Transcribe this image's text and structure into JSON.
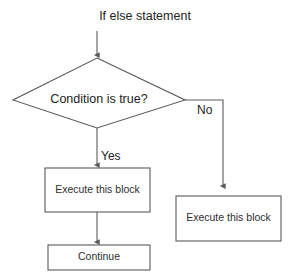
{
  "diagram": {
    "title": "If else statement",
    "type": "flowchart",
    "background_color": "#ffffff",
    "stroke_color": "#5a5a5a",
    "text_color": "#242424",
    "nodes": {
      "decision": {
        "label": "Condition is true?",
        "shape": "diamond"
      },
      "execute_true": {
        "label": "Execute this block",
        "shape": "rectangle"
      },
      "execute_false": {
        "label": "Execute this block",
        "shape": "rectangle"
      },
      "continue": {
        "label": "Continue",
        "shape": "rectangle"
      }
    },
    "edge_labels": {
      "yes": "Yes",
      "no": "No"
    }
  }
}
